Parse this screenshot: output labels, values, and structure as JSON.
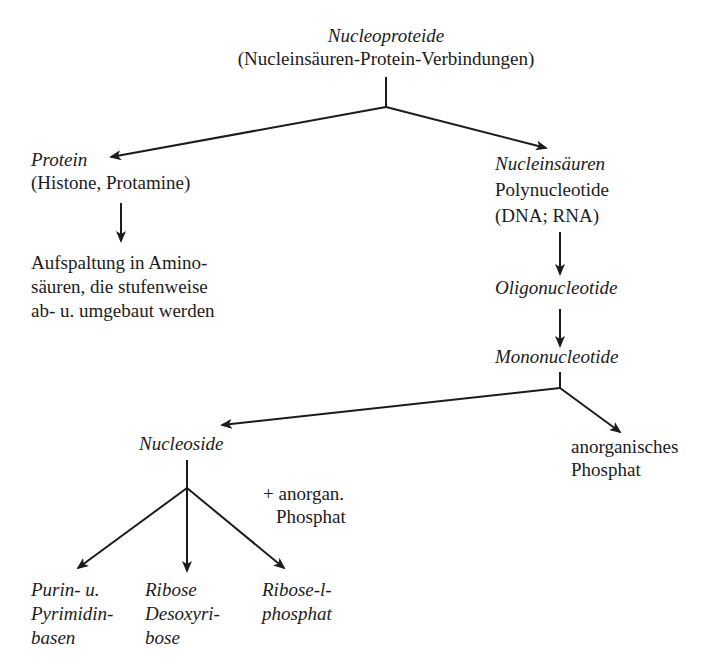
{
  "diagram": {
    "root": {
      "title": "Nucleoproteide",
      "subtitle": "(Nucleinsäuren-Protein-Verbindungen)"
    },
    "protein": {
      "title": "Protein",
      "subtitle": "(Histone, Protamine)",
      "result_lines": [
        "Aufspaltung in Amino-",
        "säuren, die stufenweise",
        "ab- u. umgebaut werden"
      ]
    },
    "nucleic_acids": {
      "title": "Nucleinsäuren",
      "line2": "Polynucleotide",
      "line3": "(DNA; RNA)"
    },
    "oligonucleotide": {
      "title": "Oligonucleotide"
    },
    "mononucleotide": {
      "title": "Mononucleotide"
    },
    "nucleoside": {
      "title": "Nucleoside",
      "note_lines": [
        "+ anorgan.",
        "Phosphat"
      ]
    },
    "inorganic_phosphate": {
      "lines": [
        "anorganisches",
        "Phosphat"
      ]
    },
    "products": [
      {
        "lines": [
          "Purin- u.",
          "Pyrimidin-",
          "basen"
        ]
      },
      {
        "lines": [
          "Ribose",
          "Desoxyri-",
          "bose"
        ]
      },
      {
        "lines": [
          "Ribose-l-",
          "phosphat"
        ]
      }
    ],
    "line_color": "#1c1c1c"
  }
}
